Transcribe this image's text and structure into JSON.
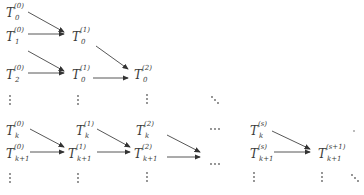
{
  "diagram": {
    "title": "",
    "nodes": [
      {
        "id": "n00",
        "base": "T",
        "sub": "0",
        "sup": "(0)",
        "x": 6,
        "y": 7
      },
      {
        "id": "n10",
        "base": "T",
        "sub": "1",
        "sup": "(0)",
        "x": 6,
        "y": 31
      },
      {
        "id": "n01a",
        "base": "T",
        "sub": "0",
        "sup": "(1)",
        "x": 72,
        "y": 31
      },
      {
        "id": "n20",
        "base": "T",
        "sub": "2",
        "sup": "(0)",
        "x": 6,
        "y": 69
      },
      {
        "id": "n01b",
        "base": "T",
        "sub": "0",
        "sup": "(1)",
        "x": 72,
        "y": 69
      },
      {
        "id": "n02",
        "base": "T",
        "sub": "0",
        "sup": "(2)",
        "x": 134,
        "y": 69
      },
      {
        "id": "nk0",
        "base": "T",
        "sub": "k",
        "sup": "(0)",
        "x": 6,
        "y": 125
      },
      {
        "id": "nk10",
        "base": "T",
        "sub": "k+1",
        "sup": "(0)",
        "x": 6,
        "y": 148
      },
      {
        "id": "nk1",
        "base": "T",
        "sub": "k",
        "sup": "(1)",
        "x": 76,
        "y": 125
      },
      {
        "id": "nk11",
        "base": "T",
        "sub": "k+1",
        "sup": "(1)",
        "x": 68,
        "y": 148
      },
      {
        "id": "nk2",
        "base": "T",
        "sub": "k",
        "sup": "(2)",
        "x": 136,
        "y": 125
      },
      {
        "id": "nk12",
        "base": "T",
        "sub": "k+1",
        "sup": "(2)",
        "x": 134,
        "y": 148
      },
      {
        "id": "nks",
        "base": "T",
        "sub": "k",
        "sup": "(s)",
        "x": 250,
        "y": 125
      },
      {
        "id": "nk1s",
        "base": "T",
        "sub": "k+1",
        "sup": "(s)",
        "x": 250,
        "y": 148
      },
      {
        "id": "nk1s1",
        "base": "T",
        "sub": "k+1",
        "sup": "(s+1)",
        "x": 318,
        "y": 148
      }
    ],
    "ellipses": {
      "hdots_label": "···",
      "ddots_label": "⋱"
    },
    "colors": {
      "ink": "#3a3a3a",
      "arrow": "#333333"
    }
  }
}
